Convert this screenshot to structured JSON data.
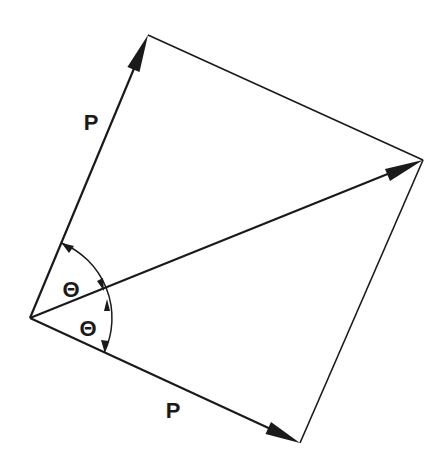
{
  "diagram": {
    "type": "vector-parallelogram",
    "colors": {
      "stroke": "#1a1a1a",
      "background": "#ffffff"
    },
    "vertices": {
      "origin": [
        30,
        318
      ],
      "top": [
        148,
        35
      ],
      "right": [
        423,
        160
      ],
      "bottom": [
        300,
        443
      ]
    },
    "vectors": [
      {
        "id": "upper-force",
        "label": "P"
      },
      {
        "id": "lower-force",
        "label": "P"
      },
      {
        "id": "resultant",
        "label": ""
      }
    ],
    "angles": [
      {
        "id": "upper-angle",
        "label": "Θ"
      },
      {
        "id": "lower-angle",
        "label": "Θ"
      }
    ]
  }
}
